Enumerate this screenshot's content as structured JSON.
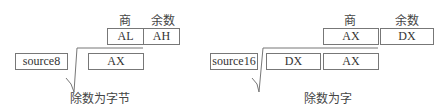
{
  "left": {
    "quotient_label": "商",
    "remainder_label": "余数",
    "quotient_reg": "AL",
    "remainder_reg": "AH",
    "divisor": "source8",
    "dividend": [
      "AX"
    ],
    "caption": "除数为字节"
  },
  "right": {
    "quotient_label": "商",
    "remainder_label": "余数",
    "quotient_reg": "AX",
    "remainder_reg": "DX",
    "divisor": "source16",
    "dividend": [
      "DX",
      "AX"
    ],
    "caption": "除数为字"
  }
}
